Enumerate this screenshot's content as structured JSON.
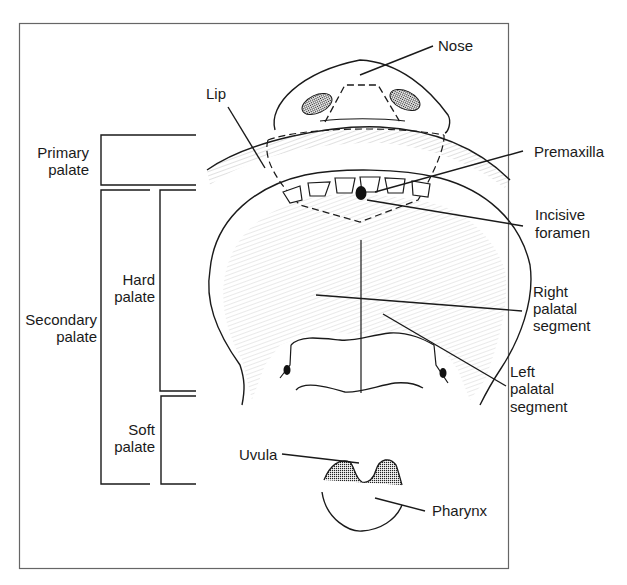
{
  "diagram": {
    "type": "anatomical-illustration",
    "colors": {
      "line": "#1a1a1a",
      "border": "#555555",
      "background": "#ffffff"
    },
    "labels": {
      "nose": "Nose",
      "lip": "Lip",
      "premaxilla": "Premaxilla",
      "incisive_foramen_1": "Incisive",
      "incisive_foramen_2": "foramen",
      "right_palatal_1": "Right",
      "right_palatal_2": "palatal",
      "right_palatal_3": "segment",
      "left_palatal_1": "Left",
      "left_palatal_2": "palatal",
      "left_palatal_3": "segment",
      "uvula": "Uvula",
      "pharynx": "Pharynx"
    },
    "brackets": {
      "primary_1": "Primary",
      "primary_2": "palate",
      "secondary_1": "Secondary",
      "secondary_2": "palate",
      "hard_1": "Hard",
      "hard_2": "palate",
      "soft_1": "Soft",
      "soft_2": "palate"
    }
  }
}
